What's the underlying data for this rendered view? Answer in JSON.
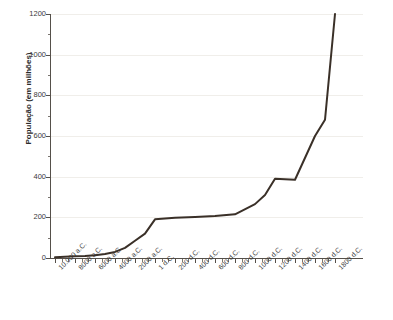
{
  "chart": {
    "title": "",
    "y_axis_label": "População (em milhões)"
  },
  "chart_data": {
    "type": "line",
    "title": "",
    "subtitle": "",
    "xlabel": "",
    "ylabel": "População (em milhões)",
    "ylim": [
      0,
      1200
    ],
    "y_ticks": [
      0,
      200,
      400,
      600,
      800,
      1000,
      1200
    ],
    "grid": true,
    "legend": null,
    "line_color": "#3a3028",
    "line_width": 2,
    "x_tick_labels": [
      "10.000 a.C.",
      "8000 a.C.",
      "6000 a.C.",
      "4000 a.C.",
      "2000 a.C.",
      "1 d.C.",
      "200 d.C.",
      "400 d.C.",
      "600 d.C.",
      "800 d.C.",
      "1000 d.C.",
      "1200 d.C.",
      "1400 d.C.",
      "1600 d.C.",
      "1800 d.C."
    ],
    "categories": [
      "10.000 a.C.",
      "8000 a.C.",
      "6000 a.C.",
      "4000 a.C.",
      "2000 a.C.",
      "1 d.C.",
      "200 d.C.",
      "400 d.C.",
      "600 d.C.",
      "800 d.C.",
      "1000 d.C.",
      "1200 d.C.",
      "1400 d.C.",
      "1600 d.C.",
      "1800 d.C."
    ],
    "series": [
      {
        "name": "População mundial",
        "points": [
          {
            "x": "10.000 a.C.",
            "y": 4
          },
          {
            "x": "9000 a.C.",
            "y": 6
          },
          {
            "x": "8000 a.C.",
            "y": 8
          },
          {
            "x": "7000 a.C.",
            "y": 10
          },
          {
            "x": "6000 a.C.",
            "y": 14
          },
          {
            "x": "5000 a.C.",
            "y": 20
          },
          {
            "x": "4000 a.C.",
            "y": 30
          },
          {
            "x": "3000 a.C.",
            "y": 50
          },
          {
            "x": "2000 a.C.",
            "y": 85
          },
          {
            "x": "1000 a.C.",
            "y": 120
          },
          {
            "x": "1 d.C.",
            "y": 190
          },
          {
            "x": "200 d.C.",
            "y": 198
          },
          {
            "x": "400 d.C.",
            "y": 202
          },
          {
            "x": "600 d.C.",
            "y": 206
          },
          {
            "x": "800 d.C.",
            "y": 215
          },
          {
            "x": "1000 d.C.",
            "y": 265
          },
          {
            "x": "1100 d.C.",
            "y": 310
          },
          {
            "x": "1200 d.C.",
            "y": 390
          },
          {
            "x": "1400 d.C.",
            "y": 385
          },
          {
            "x": "1600 d.C.",
            "y": 600
          },
          {
            "x": "1700 d.C.",
            "y": 680
          },
          {
            "x": "1800 d.C.",
            "y": 1200
          }
        ]
      }
    ]
  }
}
